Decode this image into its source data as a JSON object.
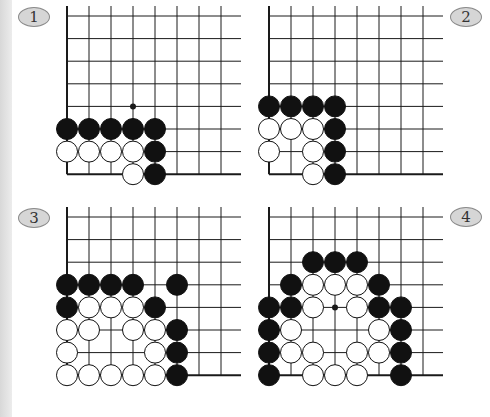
{
  "diagrams": [
    {
      "label": "1",
      "badge": {
        "cx": 34,
        "cy": 17
      },
      "origin": {
        "x": 67,
        "y": 16
      },
      "spacing_x": 22,
      "spacing_y": 22.6,
      "cols": 8,
      "rows": 8,
      "line_extend": 20,
      "hoshi": [
        [
          3,
          4
        ]
      ],
      "black": [
        [
          0,
          5
        ],
        [
          1,
          5
        ],
        [
          2,
          5
        ],
        [
          3,
          5
        ],
        [
          4,
          5
        ],
        [
          4,
          6
        ],
        [
          4,
          7
        ]
      ],
      "white": [
        [
          0,
          6
        ],
        [
          1,
          6
        ],
        [
          2,
          6
        ],
        [
          3,
          6
        ],
        [
          3,
          7
        ]
      ]
    },
    {
      "label": "2",
      "badge": {
        "cx": 466,
        "cy": 17
      },
      "origin": {
        "x": 269,
        "y": 16
      },
      "spacing_x": 22,
      "spacing_y": 22.6,
      "cols": 8,
      "rows": 8,
      "line_extend": 20,
      "hoshi": [],
      "black": [
        [
          0,
          4
        ],
        [
          1,
          4
        ],
        [
          2,
          4
        ],
        [
          3,
          4
        ],
        [
          3,
          5
        ],
        [
          3,
          6
        ],
        [
          3,
          7
        ]
      ],
      "white": [
        [
          0,
          5
        ],
        [
          1,
          5
        ],
        [
          2,
          5
        ],
        [
          0,
          6
        ],
        [
          2,
          6
        ],
        [
          2,
          7
        ]
      ]
    },
    {
      "label": "3",
      "badge": {
        "cx": 34,
        "cy": 218
      },
      "origin": {
        "x": 67,
        "y": 217
      },
      "spacing_x": 22,
      "spacing_y": 22.6,
      "cols": 8,
      "rows": 8,
      "line_extend": 20,
      "hoshi": [],
      "black": [
        [
          0,
          3
        ],
        [
          1,
          3
        ],
        [
          2,
          3
        ],
        [
          3,
          3
        ],
        [
          5,
          3
        ],
        [
          0,
          4
        ],
        [
          4,
          4
        ],
        [
          5,
          5
        ],
        [
          5,
          6
        ],
        [
          5,
          7
        ]
      ],
      "white": [
        [
          1,
          4
        ],
        [
          2,
          4
        ],
        [
          3,
          4
        ],
        [
          0,
          5
        ],
        [
          1,
          5
        ],
        [
          3,
          5
        ],
        [
          4,
          5
        ],
        [
          0,
          6
        ],
        [
          4,
          6
        ],
        [
          0,
          7
        ],
        [
          1,
          7
        ],
        [
          2,
          7
        ],
        [
          3,
          7
        ],
        [
          4,
          7
        ]
      ]
    },
    {
      "label": "4",
      "badge": {
        "cx": 466,
        "cy": 217
      },
      "origin": {
        "x": 269,
        "y": 217
      },
      "spacing_x": 22,
      "spacing_y": 22.6,
      "cols": 8,
      "rows": 8,
      "line_extend": 20,
      "hoshi": [
        [
          3,
          4
        ]
      ],
      "black": [
        [
          2,
          2
        ],
        [
          3,
          2
        ],
        [
          4,
          2
        ],
        [
          1,
          3
        ],
        [
          5,
          3
        ],
        [
          0,
          4
        ],
        [
          1,
          4
        ],
        [
          5,
          4
        ],
        [
          6,
          4
        ],
        [
          0,
          5
        ],
        [
          6,
          5
        ],
        [
          0,
          6
        ],
        [
          6,
          6
        ],
        [
          0,
          7
        ],
        [
          6,
          7
        ]
      ],
      "white": [
        [
          2,
          3
        ],
        [
          3,
          3
        ],
        [
          4,
          3
        ],
        [
          2,
          4
        ],
        [
          4,
          4
        ],
        [
          1,
          5
        ],
        [
          5,
          5
        ],
        [
          1,
          6
        ],
        [
          2,
          6
        ],
        [
          4,
          6
        ],
        [
          5,
          6
        ],
        [
          2,
          7
        ],
        [
          3,
          7
        ],
        [
          4,
          7
        ]
      ]
    }
  ],
  "colors": {
    "line": "#1a1a1a",
    "black_stone": "#111111",
    "white_stone": "#ffffff",
    "stone_outline": "#111111",
    "badge_fill": "#d6d6d6"
  }
}
